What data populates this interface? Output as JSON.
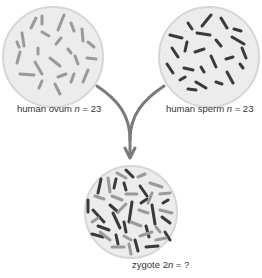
{
  "colors": {
    "cell_fill": "#ececec",
    "cell_stroke": "#d6d6d6",
    "ovum_chromosome": "#9a9a9a",
    "sperm_chromosome": "#3a3a3a",
    "arrow": "#7a7a7a",
    "text": "#333333"
  },
  "ovum": {
    "label_prefix": "human ovum ",
    "var": "n",
    "label_suffix": " = 23"
  },
  "sperm": {
    "label_prefix": "human sperm ",
    "var": "n",
    "label_suffix": " = 23"
  },
  "zygote": {
    "label_prefix": "zygote 2",
    "var": "n",
    "label_suffix": " = ?"
  }
}
